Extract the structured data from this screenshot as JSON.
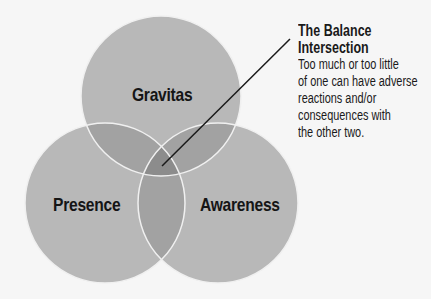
{
  "diagram": {
    "type": "venn",
    "circles": [
      {
        "label": "Gravitas",
        "cx": 161,
        "cy": 96,
        "r": 80
      },
      {
        "label": "Presence",
        "cx": 105,
        "cy": 203,
        "r": 80
      },
      {
        "label": "Awareness",
        "cx": 218,
        "cy": 203,
        "r": 80
      }
    ],
    "colors": {
      "background": "#f6f6f6",
      "circle_fill": "#b8b8b8",
      "overlap_fill": "#9e9e9e",
      "center_fill": "#8a8a8a",
      "circle_stroke": "#f2f2f2",
      "text": "#151515"
    },
    "callout": {
      "title_line1": "The Balance",
      "title_line2": "Intersection",
      "body": "Too much or too little of one can have adverse reactions and/or consequences with the other two.",
      "body_lines": [
        "Too much or too little",
        "of one can have adverse",
        "reactions and/or",
        "consequences with",
        "the other two."
      ]
    }
  }
}
